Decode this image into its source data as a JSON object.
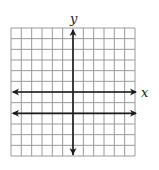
{
  "chart_data": {
    "type": "line",
    "title": "",
    "xlabel": "x",
    "ylabel": "y",
    "xlim": [
      -6,
      6
    ],
    "ylim": [
      -6,
      6
    ],
    "grid": true,
    "grid_step": 1,
    "series": [
      {
        "name": "y = -2",
        "equation": "y = -2",
        "x": [
          -6,
          6
        ],
        "y": [
          -2,
          -2
        ],
        "arrows": "both"
      }
    ],
    "axes_arrows": true,
    "tick_labels": false
  }
}
